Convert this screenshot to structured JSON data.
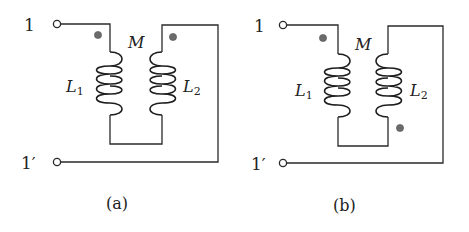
{
  "figure": {
    "panels": [
      {
        "id": "a",
        "caption": "(a)",
        "terminal_top": "1",
        "terminal_bottom": "1′",
        "inductor_left": {
          "symbol": "L",
          "subscript": "1"
        },
        "inductor_right": {
          "symbol": "L",
          "subscript": "2"
        },
        "mutual_label": "M",
        "dots": "both-top"
      },
      {
        "id": "b",
        "caption": "(b)",
        "terminal_top": "1",
        "terminal_bottom": "1′",
        "inductor_left": {
          "symbol": "L",
          "subscript": "1"
        },
        "inductor_right": {
          "symbol": "L",
          "subscript": "2"
        },
        "mutual_label": "M",
        "dots": "L1-top, L2-bottom"
      }
    ],
    "colors": {
      "wire": "#2a2a2a",
      "dot": "#6b6b6b",
      "background": "#ffffff"
    }
  }
}
